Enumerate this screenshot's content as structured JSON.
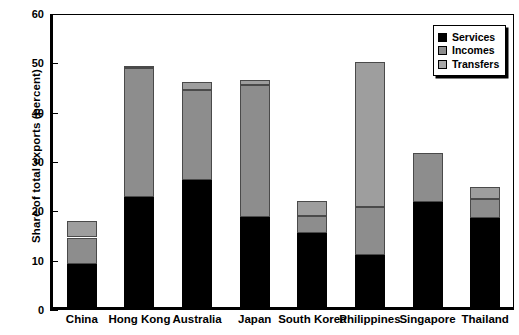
{
  "chart_data": {
    "type": "bar",
    "subtype": "stacked-bar",
    "title": "",
    "xlabel": "",
    "ylabel": "Share of total exports (percent)",
    "ylim": [
      0,
      60
    ],
    "yticks": [
      0,
      10,
      20,
      30,
      40,
      50,
      60
    ],
    "grid": false,
    "legend_position": "top-right",
    "categories": [
      "China",
      "Hong Kong",
      "Australia",
      "Japan",
      "South Korea",
      "Philippines",
      "Singapore",
      "Thailand"
    ],
    "series": [
      {
        "name": "Services",
        "color": "#000000",
        "values": [
          9.3,
          22.9,
          26.3,
          18.8,
          15.6,
          11.2,
          21.9,
          18.6
        ]
      },
      {
        "name": "Incomes",
        "color": "#8d8d8d",
        "values": [
          5.4,
          26.2,
          18.2,
          26.9,
          3.5,
          9.7,
          9.9,
          3.9
        ]
      },
      {
        "name": "Transfers",
        "color": "#9e9e9e",
        "values": [
          3.3,
          0.4,
          1.8,
          1.0,
          3.1,
          29.4,
          0.0,
          2.5
        ]
      }
    ],
    "totals": [
      18.0,
      49.5,
      46.3,
      46.7,
      22.2,
      50.3,
      31.8,
      25.0
    ]
  },
  "axis": {
    "y_title": "Share of total exports (percent)",
    "tick_labels": [
      "0",
      "10",
      "20",
      "30",
      "40",
      "50",
      "60"
    ]
  },
  "legend": {
    "items": [
      {
        "label": "Services",
        "swatch": "services"
      },
      {
        "label": "Incomes",
        "swatch": "incomes"
      },
      {
        "label": "Transfers",
        "swatch": "transfers"
      }
    ]
  }
}
